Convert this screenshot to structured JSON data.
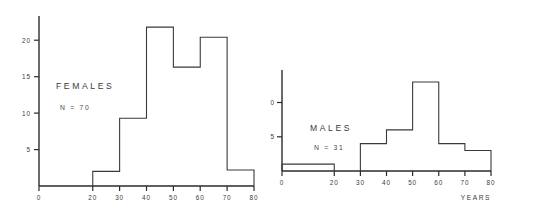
{
  "chart_data": [
    {
      "type": "bar",
      "title": "FEMALES",
      "annotation": "N = 70",
      "xlabel": "",
      "ylabel": "",
      "categories": [
        "0-10",
        "10-20",
        "20-30",
        "30-40",
        "40-50",
        "50-60",
        "60-70",
        "70-80"
      ],
      "bin_edges": [
        0,
        10,
        20,
        30,
        40,
        50,
        60,
        70,
        80
      ],
      "values": [
        0,
        0,
        2,
        9.3,
        21.8,
        16.3,
        20.4,
        2.2
      ],
      "xlim": [
        0,
        80
      ],
      "ylim": [
        0,
        22.5
      ],
      "xticks": [
        0,
        20,
        30,
        40,
        50,
        60,
        70,
        80
      ],
      "xticklabels": [
        "0",
        "20",
        "30",
        "40",
        "50",
        "60",
        "70",
        "80"
      ],
      "yticks": [
        5,
        10,
        15,
        20
      ],
      "yticklabels": [
        "5",
        "10",
        "15",
        "20"
      ],
      "grid": false,
      "legend": "none"
    },
    {
      "type": "bar",
      "title": "MALES",
      "annotation": "N = 31",
      "xlabel": "YEARS",
      "ylabel": "",
      "categories": [
        "0-10",
        "10-20",
        "20-30",
        "30-40",
        "40-50",
        "50-60",
        "60-70",
        "70-80"
      ],
      "bin_edges": [
        0,
        10,
        20,
        30,
        40,
        50,
        60,
        70,
        80
      ],
      "values": [
        1,
        1,
        0,
        4,
        6,
        13,
        4,
        3
      ],
      "xlim": [
        0,
        80
      ],
      "ylim": [
        0,
        14.5
      ],
      "xticks": [
        0,
        20,
        30,
        40,
        50,
        60,
        70,
        80
      ],
      "xticklabels": [
        "0",
        "20",
        "30",
        "40",
        "50",
        "60",
        "70",
        "80"
      ],
      "yticks": [
        5,
        10
      ],
      "yticklabels": [
        "5",
        "10"
      ],
      "grid": false,
      "legend": "none"
    }
  ],
  "females": {
    "title": "FEMALES",
    "n_label": "N = 70",
    "xticklabels": [
      "0",
      "20",
      "30",
      "40",
      "50",
      "60",
      "70",
      "80"
    ],
    "yticklabels": [
      "20",
      "15",
      "10",
      "5"
    ]
  },
  "males": {
    "title": "MALES",
    "n_label": "N = 31",
    "xticklabels": [
      "0",
      "20",
      "30",
      "40",
      "50",
      "60",
      "70",
      "80"
    ],
    "yticklabels": [
      "10",
      "5"
    ],
    "xaxis_title": "YEARS"
  },
  "colors": {
    "ink": "#2b2b2b",
    "bar_stroke": "#3a3a3a",
    "background": "#ffffff"
  }
}
